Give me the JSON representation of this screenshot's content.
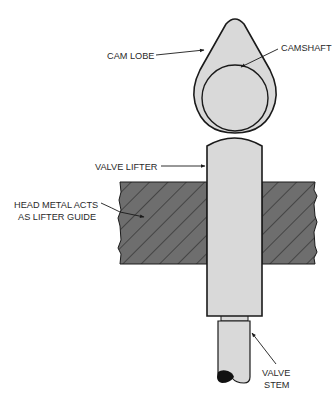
{
  "diagram": {
    "colors": {
      "part_fill": "#d9d9d9",
      "outline": "#1a1a1a",
      "head_metal_fill": "#6e6e6e",
      "hatch_line": "#2e2e2e",
      "label_text": "#2a2a2a"
    },
    "labels": {
      "cam_lobe": "CAM LOBE",
      "camshaft": "CAMSHAFT",
      "valve_lifter": "VALVE LIFTER",
      "head_metal_line1": "HEAD METAL ACTS",
      "head_metal_line2": "AS LIFTER GUIDE",
      "valve_stem_line1": "VALVE",
      "valve_stem_line2": "STEM"
    },
    "components": [
      "cam-lobe",
      "camshaft",
      "valve-lifter",
      "head-metal-left",
      "head-metal-right",
      "valve-stem"
    ]
  }
}
